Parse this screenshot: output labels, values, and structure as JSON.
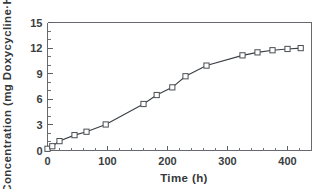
{
  "chart_data": {
    "type": "line",
    "title": "",
    "xlabel": "Time (h)",
    "ylabel": "Concentration (mg Doxycycline·HCl)",
    "xlim": [
      0,
      440
    ],
    "ylim": [
      0,
      15
    ],
    "xticks": [
      0,
      100,
      200,
      300,
      400
    ],
    "xtick_labels": [
      "0",
      "100",
      "200",
      "300",
      "400"
    ],
    "yticks": [
      0,
      3,
      6,
      9,
      12,
      15
    ],
    "ytick_labels": [
      "0",
      "3",
      "6",
      "9",
      "12",
      "15"
    ],
    "x_minor_tick_step": 20,
    "y_minor_tick_step": 1,
    "grid": false,
    "legend": null,
    "marker": "open-square",
    "series": [
      {
        "name": "Cumulative doxycycline-HCl release",
        "x": [
          0,
          8,
          20,
          45,
          65,
          97,
          160,
          182,
          208,
          230,
          265,
          325,
          350,
          375,
          400,
          422
        ],
        "y": [
          0.2,
          0.5,
          1.1,
          1.8,
          2.2,
          3.05,
          5.45,
          6.5,
          7.4,
          8.7,
          9.95,
          11.15,
          11.5,
          11.75,
          11.9,
          12.0
        ]
      }
    ]
  },
  "style": {
    "line_color": "#3b3f44",
    "marker_fill": "#ffffff",
    "marker_edge": "#4a4e53",
    "axis_color": "#666a6e",
    "text_color": "#35383c",
    "background": "#ffffff"
  },
  "icons": {
    "plot_frame": "axis-frame"
  }
}
